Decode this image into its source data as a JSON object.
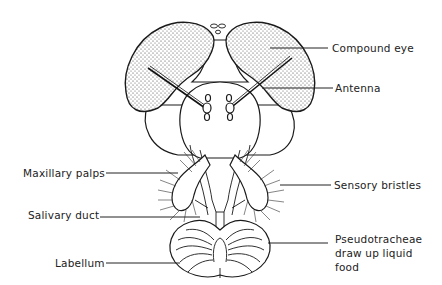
{
  "diagram": {
    "labels": {
      "compound_eye": "Compound eye",
      "antenna": "Antenna",
      "maxillary_palps": "Maxillary palps",
      "sensory_bristles": "Sensory bristles",
      "salivary_duct": "Salivary duct",
      "pseudotracheae_line1": "Pseudotracheae",
      "pseudotracheae_line2": "draw up liquid",
      "pseudotracheae_line3": "food",
      "labellum": "Labellum"
    },
    "colors": {
      "ink": "#1a1a1a",
      "background": "#ffffff"
    }
  }
}
